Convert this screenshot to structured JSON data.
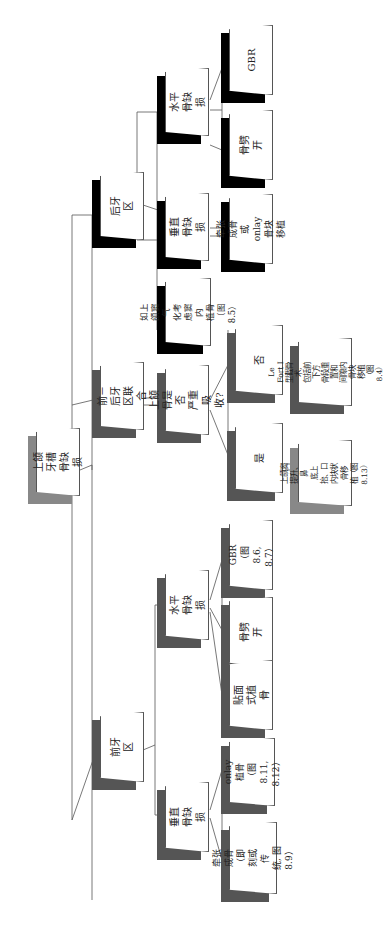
{
  "orientation": "rotated 90° counter-clockwise (text reads bottom-to-top)",
  "nodes": {
    "root": {
      "label": "上颌牙槽\n骨缺损"
    },
    "posterior": {
      "label": "后牙区"
    },
    "posterior_horizontal": {
      "label": "水平骨缺损"
    },
    "posterior_horizontal_gbr": {
      "label": "GBR"
    },
    "posterior_horizontal_split": {
      "label": "骨劈开"
    },
    "posterior_vertical": {
      "label": "垂直骨缺损"
    },
    "posterior_vertical_opt": {
      "label": "牵张成骨\n或 onlay\n骨块移植"
    },
    "posterior_sinus": {
      "label": "如上颌窦气\n化考虑窦内\n植骨（图8.5）"
    },
    "combined": {
      "label": "前－后牙\n区联合"
    },
    "combined_question": {
      "label": "上颌骨是否\n严重吸收?"
    },
    "combined_no": {
      "label": "否"
    },
    "combined_no_opt": {
      "label": "Le Fort I\n型截骨术,\n包括前下方\n骨段重置和\n间隙内骨块\n移植（图8.4）"
    },
    "combined_yes": {
      "label": "是"
    },
    "combined_yes_opt": {
      "label": "上颌窦\n提升、鼻\n底上抬、口\n内块状骨移\n植（图8.13）"
    },
    "anterior": {
      "label": "前牙区"
    },
    "anterior_horizontal": {
      "label": "水平骨缺损"
    },
    "anterior_horizontal_gbr": {
      "label": "GBR（图\n8.6, 8.7）"
    },
    "anterior_horizontal_split": {
      "label": "骨劈开"
    },
    "anterior_horizontal_veneer": {
      "label": "贴面式植骨"
    },
    "anterior_vertical": {
      "label": "垂直骨缺损"
    },
    "anterior_vertical_onlay": {
      "label": "onlay 植骨\n（图8.11,\n8.12）"
    },
    "anterior_vertical_distraction": {
      "label": "牵张成骨\n（即刻或传\n统, 图8.9）"
    }
  },
  "colors": {
    "line": "#555555",
    "box_fill": "#ffffff",
    "shadow_dark": "#000000",
    "shadow_mid": "#555555",
    "shadow_light": "#888888"
  }
}
